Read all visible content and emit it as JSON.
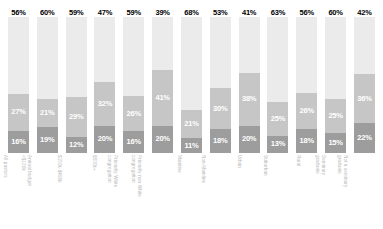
{
  "chart_data": {
    "type": "bar",
    "subtype": "stacked-bar-100",
    "title": "",
    "subtitle": "",
    "xlabel": "",
    "ylabel": "",
    "ylim": [
      0,
      100
    ],
    "grid": false,
    "legend_position": "none",
    "value_suffix": "%",
    "colors": {
      "top": "#ebebeb",
      "middle": "#c6c6c6",
      "bottom": "#9d9d9d",
      "top_label_text": "#000000",
      "inner_label_text": "#ffffff",
      "axis_label_text": "#b9b9b9",
      "background": "#ffffff"
    },
    "categories": [
      "All pastors",
      "Annual budget <$100k",
      "$150k-$499k",
      "$500k+",
      "Primarily White congregation",
      "Primarily non-White congregation",
      "Mainline",
      "Non-Mainline",
      "Urban",
      "Suburban",
      "Rural",
      "Seminary graduate",
      "Not a seminary graduate"
    ],
    "category_lines": [
      [
        "All pastors",
        ""
      ],
      [
        "Annual budget",
        "<$100k"
      ],
      [
        "$150k-$499k",
        ""
      ],
      [
        "$500k+",
        ""
      ],
      [
        "Primarily White",
        "congregation"
      ],
      [
        "Primarily non-White",
        "congregation"
      ],
      [
        "Mainline",
        ""
      ],
      [
        "Non-Mainline",
        ""
      ],
      [
        "Urban",
        ""
      ],
      [
        "Suburban",
        ""
      ],
      [
        "Rural",
        ""
      ],
      [
        "Seminary",
        "graduate"
      ],
      [
        "Not a seminary",
        "graduate"
      ]
    ],
    "series": [
      {
        "name": "top",
        "values": [
          56,
          60,
          59,
          47,
          59,
          39,
          68,
          53,
          41,
          63,
          56,
          60,
          42
        ],
        "labels": [
          "56%",
          "60%",
          "59%",
          "47%",
          "59%",
          "39%",
          "68%",
          "53%",
          "41%",
          "63%",
          "56%",
          "60%",
          "42%"
        ]
      },
      {
        "name": "middle",
        "values": [
          27,
          21,
          29,
          32,
          26,
          41,
          21,
          30,
          38,
          25,
          26,
          25,
          36
        ],
        "labels": [
          "27%",
          "21%",
          "29%",
          "32%",
          "26%",
          "41%",
          "21%",
          "30%",
          "38%",
          "25%",
          "26%",
          "25%",
          "36%"
        ]
      },
      {
        "name": "bottom",
        "values": [
          16,
          19,
          12,
          20,
          16,
          20,
          11,
          18,
          20,
          13,
          18,
          15,
          22
        ],
        "labels": [
          "16%",
          "19%",
          "12%",
          "20%",
          "16%",
          "20%",
          "11%",
          "18%",
          "20%",
          "13%",
          "18%",
          "15%",
          "22%"
        ]
      }
    ]
  }
}
